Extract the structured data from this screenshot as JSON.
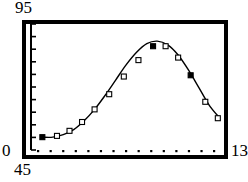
{
  "chart_data": {
    "type": "line",
    "title": "",
    "xlabel": "",
    "ylabel": "",
    "xlim": [
      45,
      135
    ],
    "ylim": [
      0,
      95
    ],
    "grid": false,
    "legend": null,
    "axis_labels": {
      "y_max": "95",
      "y_min": "0",
      "x_min": "45",
      "x_max": "13"
    },
    "y_tick_count": 10,
    "x_tick_count": 15,
    "marker_styles": {
      "open": "open-square",
      "filled": "filled-square"
    },
    "series": [
      {
        "name": "curve",
        "x": [
          49,
          54,
          59,
          64,
          69,
          74,
          79,
          84,
          89,
          94,
          99,
          104,
          109,
          114,
          119,
          124,
          129,
          134
        ],
        "y": [
          7,
          7,
          9,
          13,
          20,
          29,
          40,
          52,
          64,
          74,
          81,
          83,
          80,
          72,
          60,
          46,
          32,
          22
        ]
      }
    ],
    "points": [
      {
        "x": 49,
        "y": 7,
        "marker": "filled"
      },
      {
        "x": 56,
        "y": 8,
        "marker": "open"
      },
      {
        "x": 62,
        "y": 12,
        "marker": "open"
      },
      {
        "x": 68,
        "y": 19,
        "marker": "open"
      },
      {
        "x": 74,
        "y": 29,
        "marker": "open"
      },
      {
        "x": 81,
        "y": 41,
        "marker": "open"
      },
      {
        "x": 88,
        "y": 55,
        "marker": "open"
      },
      {
        "x": 95,
        "y": 68,
        "marker": "open"
      },
      {
        "x": 102,
        "y": 79,
        "marker": "filled"
      },
      {
        "x": 108,
        "y": 79,
        "marker": "open"
      },
      {
        "x": 114,
        "y": 70,
        "marker": "open"
      },
      {
        "x": 120,
        "y": 56,
        "marker": "filled"
      },
      {
        "x": 127,
        "y": 35,
        "marker": "open"
      },
      {
        "x": 133,
        "y": 22,
        "marker": "open"
      }
    ]
  }
}
